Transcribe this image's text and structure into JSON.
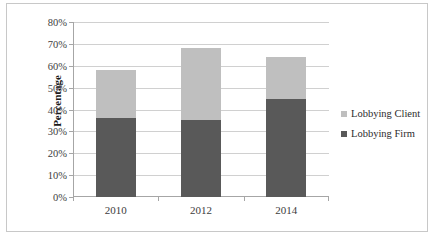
{
  "chart_data": {
    "type": "bar",
    "subtype": "stacked-bar",
    "title": "",
    "subtitle": "",
    "xlabel": "",
    "ylabel": "Percentage",
    "categories": [
      "2010",
      "2012",
      "2014"
    ],
    "series": [
      {
        "name": "Lobbying Firm",
        "color": "#595959",
        "values": [
          36,
          35,
          45
        ]
      },
      {
        "name": "Lobbying Client",
        "color": "#bfbfbf",
        "values": [
          22,
          33,
          19
        ]
      }
    ],
    "stack_totals": [
      58,
      68,
      64
    ],
    "ylim": [
      0,
      80
    ],
    "ytick_values": [
      0,
      10,
      20,
      30,
      40,
      50,
      60,
      70,
      80
    ],
    "ytick_labels": [
      "0%",
      "10%",
      "20%",
      "30%",
      "40%",
      "50%",
      "60%",
      "70%",
      "80%"
    ],
    "yaxis_unit": "percent",
    "grid": true,
    "grid_axis": "y",
    "legend_position": "right",
    "legend_entries": [
      "Lobbying Client",
      "Lobbying Firm"
    ],
    "stack_order_bottom_to_top": [
      "Lobbying Firm",
      "Lobbying Client"
    ],
    "colors": {
      "lobbying_firm": "#595959",
      "lobbying_client": "#bfbfbf",
      "gridline": "#d0d0d0",
      "axis": "#a6a6a6",
      "frame": "#c8c8c8",
      "background": "#ffffff",
      "text": "#3d3d3d"
    }
  }
}
